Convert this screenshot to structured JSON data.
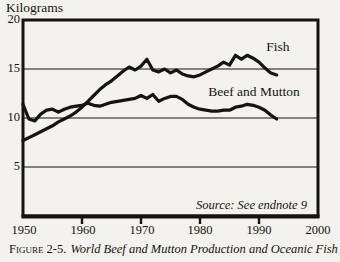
{
  "page": {
    "background": "#f4f2ee",
    "ink": "#17130e"
  },
  "chart": {
    "y_axis_title": "Kilograms",
    "y_ticks": {
      "t20": "20",
      "t15": "15",
      "t10": "10",
      "t5": "5"
    },
    "x_ticks": {
      "t1950": "1950",
      "t1960": "1960",
      "t1970": "1970",
      "t1980": "1980",
      "t1990": "1990",
      "t2000": "2000"
    },
    "labels": {
      "fish": "Fish",
      "beef": "Beef and Mutton"
    },
    "source_note": "Source: See endnote 9",
    "caption_prefix": "Figure 2-5.",
    "caption_title": "World Beef and Mutton Production and Oceanic Fish"
  },
  "chart_data": {
    "type": "line",
    "xlabel": "",
    "ylabel": "Kilograms",
    "xlim": [
      1950,
      2000
    ],
    "ylim": [
      0,
      20
    ],
    "y_gridlines": [
      5,
      10,
      15
    ],
    "x_tick_years": [
      1950,
      1960,
      1970,
      1980,
      1990,
      2000
    ],
    "grid": "horizontal-only",
    "legend_position": "inline-annotations",
    "line_color": "#17130e",
    "x": [
      1950,
      1951,
      1952,
      1953,
      1954,
      1955,
      1956,
      1957,
      1958,
      1959,
      1960,
      1961,
      1962,
      1963,
      1964,
      1965,
      1966,
      1967,
      1968,
      1969,
      1970,
      1971,
      1972,
      1973,
      1974,
      1975,
      1976,
      1977,
      1978,
      1979,
      1980,
      1981,
      1982,
      1983,
      1984,
      1985,
      1986,
      1987,
      1988,
      1989,
      1990,
      1991,
      1992,
      1993
    ],
    "series": [
      {
        "name": "Fish",
        "values": [
          7.7,
          8.0,
          8.3,
          8.6,
          8.9,
          9.2,
          9.6,
          9.9,
          10.2,
          10.6,
          11.1,
          11.7,
          12.3,
          12.9,
          13.4,
          13.8,
          14.3,
          14.8,
          15.2,
          14.9,
          15.3,
          16.0,
          14.9,
          14.7,
          15.0,
          14.6,
          14.9,
          14.5,
          14.3,
          14.2,
          14.4,
          14.7,
          15.0,
          15.3,
          15.7,
          15.4,
          16.4,
          16.0,
          16.4,
          16.1,
          15.7,
          15.1,
          14.6,
          14.4
        ]
      },
      {
        "name": "Beef and Mutton",
        "values": [
          11.4,
          9.9,
          9.7,
          10.4,
          10.8,
          10.9,
          10.6,
          10.9,
          11.1,
          11.2,
          11.3,
          11.5,
          11.3,
          11.2,
          11.4,
          11.6,
          11.7,
          11.8,
          11.9,
          12.0,
          12.3,
          12.0,
          12.4,
          11.7,
          12.0,
          12.2,
          12.2,
          11.9,
          11.4,
          11.1,
          10.9,
          10.8,
          10.7,
          10.7,
          10.8,
          10.8,
          11.1,
          11.2,
          11.4,
          11.3,
          11.1,
          10.8,
          10.3,
          9.9
        ]
      }
    ],
    "source": "Source: See endnote 9"
  }
}
